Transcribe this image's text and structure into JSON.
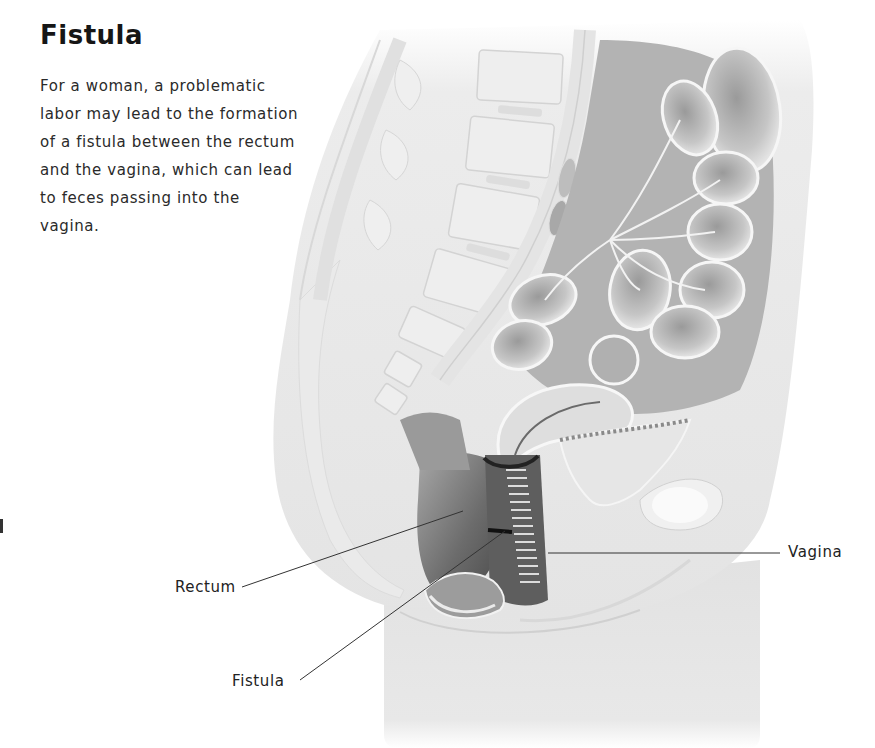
{
  "header": {
    "title": "Fistula",
    "description": "For a woman, a problematic labor may lead to the formation of a fistula between the rectum and the vagina, which can lead to feces passing into the vagina."
  },
  "figure": {
    "labels": [
      {
        "id": "rectum",
        "text": "Rectum"
      },
      {
        "id": "fistula",
        "text": "Fistula"
      },
      {
        "id": "vagina",
        "text": "Vagina"
      }
    ]
  },
  "colors": {
    "background": "#ffffff",
    "skin": "#e8e8e8",
    "tissue_light": "#f1f1f1",
    "tissue_mid": "#c8c8c8",
    "tissue_dark": "#6e6e6e",
    "leader_line": "#333333",
    "text": "#222222"
  }
}
